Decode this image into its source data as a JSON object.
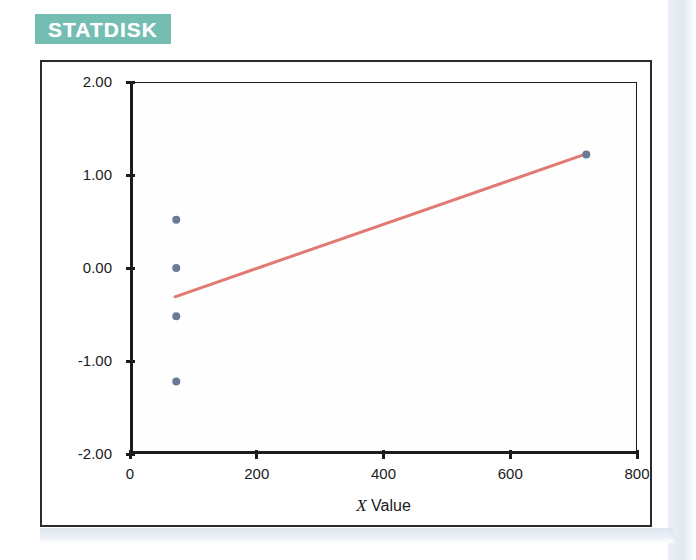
{
  "banner": {
    "label": "STATDISK",
    "background_color": "#73bdb2",
    "text_color": "#ffffff"
  },
  "chart_data": {
    "type": "scatter",
    "title": "",
    "subtitle": "",
    "xlabel_plain": "Value",
    "xlabel_italic_prefix": "X",
    "xlabel": "X Value",
    "ylabel": "",
    "xlim": [
      0,
      800
    ],
    "ylim": [
      -2.0,
      2.0
    ],
    "xticks": [
      0,
      200,
      400,
      600,
      800
    ],
    "xtick_labels": [
      "0",
      "200",
      "400",
      "600",
      "800"
    ],
    "yticks": [
      2.0,
      1.0,
      0.0,
      -1.0,
      -2.0
    ],
    "ytick_labels": [
      "2.00",
      "1.00",
      "0.00",
      "-1.00",
      "-2.00"
    ],
    "grid": false,
    "legend": false,
    "legend_position": "none",
    "series": [
      {
        "name": "Data Points",
        "type": "scatter",
        "marker": "circle",
        "marker_color": "#6b7a96",
        "marker_size": 8,
        "points": [
          {
            "x": 73,
            "y": 0.52
          },
          {
            "x": 73,
            "y": 0.0
          },
          {
            "x": 73,
            "y": -0.52
          },
          {
            "x": 73,
            "y": -1.22
          },
          {
            "x": 720,
            "y": 1.22
          }
        ]
      },
      {
        "name": "Regression Line",
        "type": "line",
        "line_color": "#e07a72",
        "line_width": 3,
        "points": [
          {
            "x": 71,
            "y": -0.31
          },
          {
            "x": 721,
            "y": 1.23
          }
        ]
      }
    ]
  },
  "axes": {
    "x_axis_name": "x-axis",
    "y_axis_name": "y-axis"
  }
}
